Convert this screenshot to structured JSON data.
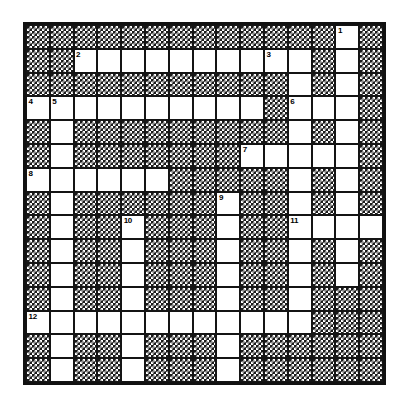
{
  "puzzle": {
    "title": "Crossword Puzzle Grid",
    "type": "crossword",
    "rows": 15,
    "cols": 15,
    "cell_size": 24.2,
    "colors": {
      "open_cell": "#ffffff",
      "blocked_cell": "#1a1a1a",
      "border": "#111111",
      "number_text": "#000000"
    },
    "grid": [
      "...#...........#...#...#...#1..#...",
      "",
      ""
    ],
    "open_cells": [
      {
        "r": 0,
        "c": 13,
        "n": "1"
      },
      {
        "r": 1,
        "c": 2,
        "n": "2"
      },
      {
        "r": 1,
        "c": 3,
        "n": ""
      },
      {
        "r": 1,
        "c": 4,
        "n": ""
      },
      {
        "r": 1,
        "c": 5,
        "n": ""
      },
      {
        "r": 1,
        "c": 6,
        "n": ""
      },
      {
        "r": 1,
        "c": 7,
        "n": ""
      },
      {
        "r": 1,
        "c": 8,
        "n": ""
      },
      {
        "r": 1,
        "c": 9,
        "n": ""
      },
      {
        "r": 1,
        "c": 10,
        "n": "3"
      },
      {
        "r": 1,
        "c": 11,
        "n": ""
      },
      {
        "r": 1,
        "c": 13,
        "n": ""
      },
      {
        "r": 2,
        "c": 11,
        "n": ""
      },
      {
        "r": 2,
        "c": 13,
        "n": ""
      },
      {
        "r": 3,
        "c": 0,
        "n": "4"
      },
      {
        "r": 3,
        "c": 1,
        "n": "5"
      },
      {
        "r": 3,
        "c": 2,
        "n": ""
      },
      {
        "r": 3,
        "c": 3,
        "n": ""
      },
      {
        "r": 3,
        "c": 4,
        "n": ""
      },
      {
        "r": 3,
        "c": 5,
        "n": ""
      },
      {
        "r": 3,
        "c": 6,
        "n": ""
      },
      {
        "r": 3,
        "c": 7,
        "n": ""
      },
      {
        "r": 3,
        "c": 8,
        "n": ""
      },
      {
        "r": 3,
        "c": 9,
        "n": ""
      },
      {
        "r": 3,
        "c": 11,
        "n": "6"
      },
      {
        "r": 3,
        "c": 12,
        "n": ""
      },
      {
        "r": 3,
        "c": 13,
        "n": ""
      },
      {
        "r": 4,
        "c": 1,
        "n": ""
      },
      {
        "r": 4,
        "c": 11,
        "n": ""
      },
      {
        "r": 4,
        "c": 13,
        "n": ""
      },
      {
        "r": 5,
        "c": 1,
        "n": ""
      },
      {
        "r": 5,
        "c": 9,
        "n": "7"
      },
      {
        "r": 5,
        "c": 10,
        "n": ""
      },
      {
        "r": 5,
        "c": 11,
        "n": ""
      },
      {
        "r": 5,
        "c": 12,
        "n": ""
      },
      {
        "r": 5,
        "c": 13,
        "n": ""
      },
      {
        "r": 6,
        "c": 0,
        "n": "8"
      },
      {
        "r": 6,
        "c": 1,
        "n": ""
      },
      {
        "r": 6,
        "c": 2,
        "n": ""
      },
      {
        "r": 6,
        "c": 3,
        "n": ""
      },
      {
        "r": 6,
        "c": 4,
        "n": ""
      },
      {
        "r": 6,
        "c": 5,
        "n": ""
      },
      {
        "r": 6,
        "c": 11,
        "n": ""
      },
      {
        "r": 6,
        "c": 13,
        "n": ""
      },
      {
        "r": 7,
        "c": 1,
        "n": ""
      },
      {
        "r": 7,
        "c": 8,
        "n": "9"
      },
      {
        "r": 7,
        "c": 11,
        "n": ""
      },
      {
        "r": 7,
        "c": 13,
        "n": ""
      },
      {
        "r": 8,
        "c": 1,
        "n": ""
      },
      {
        "r": 8,
        "c": 4,
        "n": "10"
      },
      {
        "r": 8,
        "c": 8,
        "n": ""
      },
      {
        "r": 8,
        "c": 11,
        "n": "11"
      },
      {
        "r": 8,
        "c": 12,
        "n": ""
      },
      {
        "r": 8,
        "c": 13,
        "n": ""
      },
      {
        "r": 8,
        "c": 14,
        "n": ""
      },
      {
        "r": 9,
        "c": 1,
        "n": ""
      },
      {
        "r": 9,
        "c": 4,
        "n": ""
      },
      {
        "r": 9,
        "c": 8,
        "n": ""
      },
      {
        "r": 9,
        "c": 11,
        "n": ""
      },
      {
        "r": 9,
        "c": 13,
        "n": ""
      },
      {
        "r": 10,
        "c": 1,
        "n": ""
      },
      {
        "r": 10,
        "c": 4,
        "n": ""
      },
      {
        "r": 10,
        "c": 8,
        "n": ""
      },
      {
        "r": 10,
        "c": 11,
        "n": ""
      },
      {
        "r": 10,
        "c": 13,
        "n": ""
      },
      {
        "r": 11,
        "c": 1,
        "n": ""
      },
      {
        "r": 11,
        "c": 4,
        "n": ""
      },
      {
        "r": 11,
        "c": 8,
        "n": ""
      },
      {
        "r": 11,
        "c": 11,
        "n": ""
      },
      {
        "r": 12,
        "c": 0,
        "n": "12"
      },
      {
        "r": 12,
        "c": 1,
        "n": ""
      },
      {
        "r": 12,
        "c": 2,
        "n": ""
      },
      {
        "r": 12,
        "c": 3,
        "n": ""
      },
      {
        "r": 12,
        "c": 4,
        "n": ""
      },
      {
        "r": 12,
        "c": 5,
        "n": ""
      },
      {
        "r": 12,
        "c": 6,
        "n": ""
      },
      {
        "r": 12,
        "c": 7,
        "n": ""
      },
      {
        "r": 12,
        "c": 8,
        "n": ""
      },
      {
        "r": 12,
        "c": 9,
        "n": ""
      },
      {
        "r": 12,
        "c": 10,
        "n": ""
      },
      {
        "r": 12,
        "c": 11,
        "n": ""
      },
      {
        "r": 13,
        "c": 1,
        "n": ""
      },
      {
        "r": 13,
        "c": 4,
        "n": ""
      },
      {
        "r": 13,
        "c": 8,
        "n": ""
      },
      {
        "r": 14,
        "c": 1,
        "n": ""
      },
      {
        "r": 14,
        "c": 4,
        "n": ""
      },
      {
        "r": 14,
        "c": 8,
        "n": ""
      }
    ],
    "clue_numbers": [
      "1",
      "2",
      "3",
      "4",
      "5",
      "6",
      "7",
      "8",
      "9",
      "10",
      "11",
      "12"
    ]
  }
}
